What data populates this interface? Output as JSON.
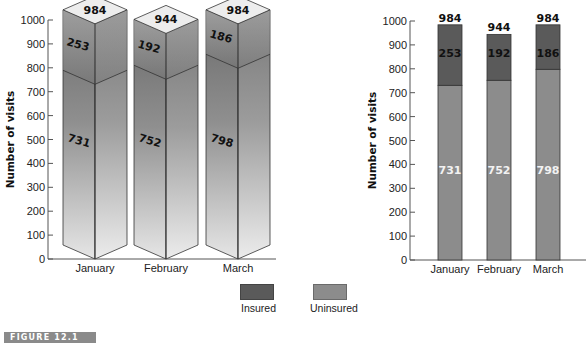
{
  "figure_label": "FIGURE 12.1",
  "legend": {
    "items": [
      {
        "label": "Insured",
        "color": "#5a5a5a"
      },
      {
        "label": "Uninsured",
        "color": "#8c8c8c"
      }
    ]
  },
  "chart_data": [
    {
      "type": "bar",
      "style": "3d-stacked",
      "title": "",
      "xlabel": "",
      "ylabel": "Number of visits",
      "ylim": [
        0,
        1000
      ],
      "yticks": [
        0,
        100,
        200,
        300,
        400,
        500,
        600,
        700,
        800,
        900,
        1000
      ],
      "categories": [
        "January",
        "February",
        "March"
      ],
      "series": [
        {
          "name": "Uninsured",
          "values": [
            731,
            752,
            798
          ]
        },
        {
          "name": "Insured",
          "values": [
            253,
            192,
            186
          ]
        }
      ],
      "totals": [
        984,
        944,
        984
      ],
      "grid": false,
      "legend_position": "bottom-center"
    },
    {
      "type": "bar",
      "style": "stacked",
      "title": "",
      "xlabel": "",
      "ylabel": "Number of visits",
      "ylim": [
        0,
        1000
      ],
      "yticks": [
        0,
        100,
        200,
        300,
        400,
        500,
        600,
        700,
        800,
        900,
        1000
      ],
      "categories": [
        "January",
        "February",
        "March"
      ],
      "series": [
        {
          "name": "Uninsured",
          "values": [
            731,
            752,
            798
          ]
        },
        {
          "name": "Insured",
          "values": [
            253,
            192,
            186
          ]
        }
      ],
      "totals": [
        984,
        944,
        984
      ],
      "grid": false,
      "legend_position": "bottom-center"
    }
  ]
}
